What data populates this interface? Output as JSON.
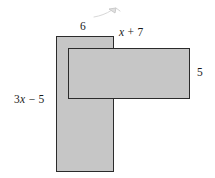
{
  "figure": {
    "type": "composite-rectangle-diagram",
    "background_color": "#ffffff",
    "fill_color": "#c6c6c6",
    "stroke_color": "#2b2b2b",
    "text_color": "#191919",
    "shapes": [
      {
        "name": "vertical-rectangle",
        "x": 56,
        "y": 36,
        "width": 58,
        "height": 136
      },
      {
        "name": "horizontal-rectangle",
        "x": 68,
        "y": 48,
        "width": 122,
        "height": 51
      }
    ],
    "labels": {
      "top_left": {
        "text": "6",
        "position": "above-vertical-rectangle"
      },
      "top_right": {
        "prefix": "",
        "variable": "x",
        "suffix": " + 7",
        "text": "x + 7",
        "position": "above-horizontal-rectangle"
      },
      "right": {
        "text": "5",
        "position": "right-of-horizontal-rectangle"
      },
      "left": {
        "prefix": "3",
        "variable": "x",
        "suffix": " − 5",
        "text": "3x − 5",
        "position": "left-of-vertical-rectangle"
      }
    },
    "artifact": {
      "name": "pencil-scribble",
      "visible": true
    }
  }
}
